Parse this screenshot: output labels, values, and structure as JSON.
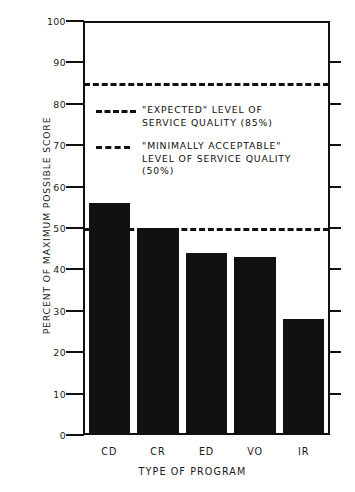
{
  "chart_data": {
    "type": "bar",
    "title": "",
    "categories": [
      "CD",
      "CR",
      "ED",
      "VO",
      "IR"
    ],
    "values": [
      56,
      50,
      44,
      43,
      28
    ],
    "xlabel": "TYPE OF PROGRAM",
    "ylabel": "PERCENT OF MAXIMUM POSSIBLE SCORE",
    "ylim": [
      0,
      100
    ],
    "ytick_labels": [
      "100",
      "90",
      "80",
      "70",
      "60",
      "50",
      "40",
      "30",
      "20",
      "10",
      "0"
    ],
    "ytick_values": [
      100,
      90,
      80,
      70,
      60,
      50,
      40,
      30,
      20,
      10,
      0
    ],
    "grid": false,
    "legend_position": "inside-upper-left",
    "bar_color": "#111111",
    "axis_color": "#111111",
    "reference_lines": [
      {
        "name": "expected",
        "value": 85,
        "style": "long-dash",
        "label": "\"EXPECTED\" LEVEL OF\nSERVICE QUALITY  (85%)"
      },
      {
        "name": "minimally-acceptable",
        "value": 50,
        "style": "short-dash",
        "label": "\"MINIMALLY ACCEPTABLE\"\nLEVEL OF SERVICE QUALITY\n(50%)"
      }
    ],
    "series": [
      {
        "name": "Percent of maximum possible score",
        "values": [
          56,
          50,
          44,
          43,
          28
        ]
      }
    ]
  },
  "axes": {
    "y_title": "PERCENT OF MAXIMUM POSSIBLE SCORE",
    "x_title": "TYPE OF PROGRAM"
  },
  "legend": {
    "entries": [
      {
        "swatch": "long-dash",
        "text": "\"EXPECTED\" LEVEL OF\nSERVICE QUALITY  (85%)"
      },
      {
        "swatch": "short-dash",
        "text": "\"MINIMALLY ACCEPTABLE\"\nLEVEL OF SERVICE QUALITY\n(50%)"
      }
    ]
  }
}
